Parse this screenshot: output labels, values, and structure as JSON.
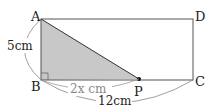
{
  "diagram": {
    "type": "geometry",
    "shape": "rectangle ABCD with shaded triangle ABP",
    "vertices": {
      "A": {
        "label": "A"
      },
      "B": {
        "label": "B"
      },
      "C": {
        "label": "C"
      },
      "D": {
        "label": "D"
      },
      "P": {
        "label": "P"
      }
    },
    "dimensions": {
      "AB": "5cm",
      "BP": "2x cm",
      "BC": "12cm"
    },
    "colors": {
      "shaded": "#c8c8c8",
      "line": "#444444",
      "dim_curve": "#888888"
    }
  }
}
